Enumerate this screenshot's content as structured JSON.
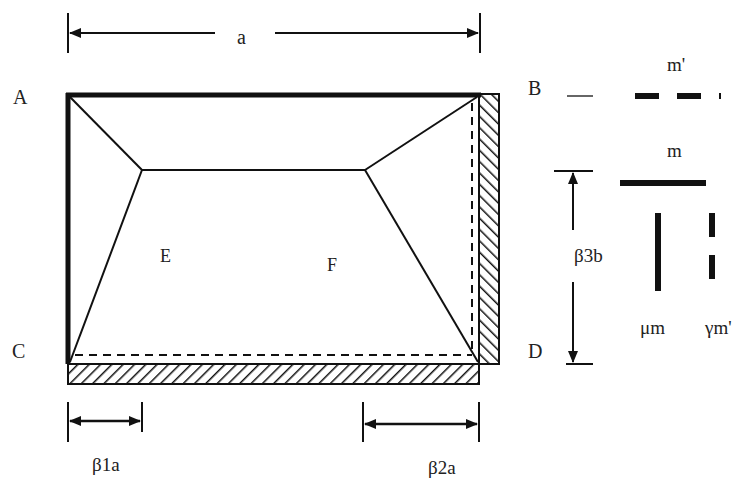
{
  "diagram": {
    "corners": {
      "top_left": "A",
      "top_right": "B",
      "bottom_left": "C",
      "bottom_right": "D"
    },
    "regions": {
      "left_interior": "E",
      "right_interior": "F"
    },
    "dimensions": {
      "width": "a",
      "left_offset": "β1a",
      "right_offset": "β2a",
      "height_offset": "β3b"
    },
    "legend": {
      "negative_moment_label": "m'",
      "positive_moment_label": "m",
      "vertical_positive_label": "μm",
      "vertical_negative_label": "γm'"
    },
    "colors": {
      "ink": "#111111",
      "background": "#ffffff"
    }
  }
}
